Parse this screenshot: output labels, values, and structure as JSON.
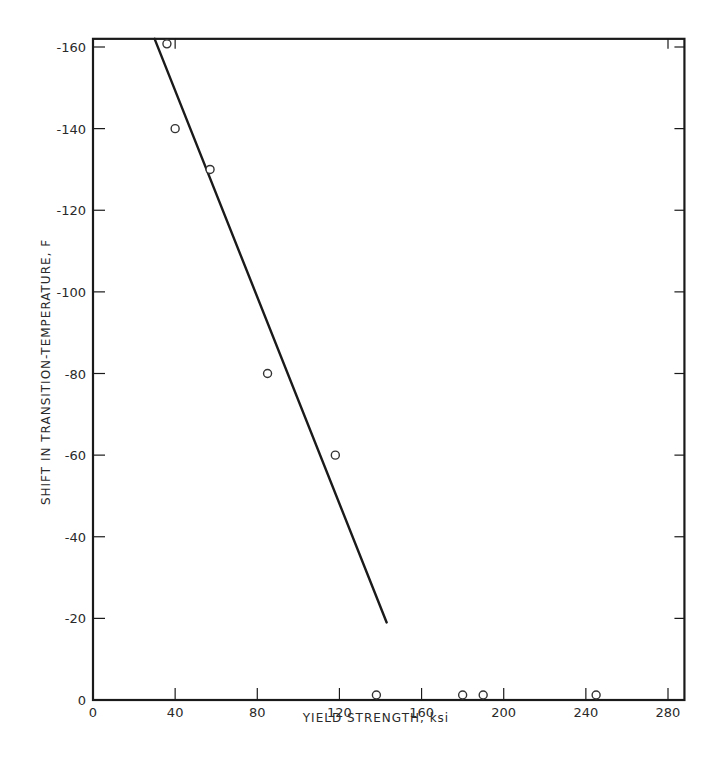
{
  "chart_data": {
    "type": "scatter",
    "title": "",
    "xlabel": "YIELD STRENGTH, ksi",
    "ylabel": "SHIFT IN TRANSITION-TEMPERATURE, F",
    "xlim": [
      0,
      288
    ],
    "ylim": [
      0,
      -162
    ],
    "x_ticks": [
      0,
      40,
      80,
      120,
      160,
      200,
      240,
      280
    ],
    "x_tick_labels": [
      "0",
      "40",
      "80",
      "120",
      "160",
      "200",
      "240",
      "280"
    ],
    "y_ticks": [
      0,
      -20,
      -40,
      -60,
      -80,
      -100,
      -120,
      -140,
      -160
    ],
    "y_tick_labels": [
      "0",
      "-20",
      "-40",
      "-60",
      "-80",
      "-100",
      "-120",
      "-140",
      "-160"
    ],
    "grid": false,
    "legend": null,
    "series": [
      {
        "name": "data points",
        "marker": "open-circle",
        "points": [
          {
            "x": 36,
            "y": -161
          },
          {
            "x": 40,
            "y": -140
          },
          {
            "x": 57,
            "y": -130
          },
          {
            "x": 85,
            "y": -80
          },
          {
            "x": 118,
            "y": -60
          },
          {
            "x": 138,
            "y": 0
          },
          {
            "x": 180,
            "y": 0
          },
          {
            "x": 190,
            "y": 0
          },
          {
            "x": 245,
            "y": 0
          }
        ]
      },
      {
        "name": "trend line",
        "type": "line",
        "points": [
          {
            "x": 30,
            "y": -162
          },
          {
            "x": 143,
            "y": -19
          }
        ]
      }
    ]
  },
  "labels": {
    "xlabel": "YIELD STRENGTH, ksi",
    "ylabel": "SHIFT IN TRANSITION-TEMPERATURE, F"
  }
}
